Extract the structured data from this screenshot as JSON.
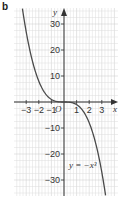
{
  "panel_label": "b",
  "chart_data": {
    "type": "line",
    "title": "",
    "xlabel": "x",
    "ylabel": "y",
    "origin_label": "O",
    "equation_label": "y = −x³",
    "xlim": [
      -4,
      4
    ],
    "ylim": [
      -36,
      36
    ],
    "grid": true,
    "x_ticks": [
      -3,
      -2,
      -1,
      1,
      2,
      3
    ],
    "x_tick_labels": [
      "−3",
      "−2",
      "−1",
      "1",
      "2",
      "3"
    ],
    "y_ticks": [
      30,
      20,
      10,
      -10,
      -20,
      -30
    ],
    "y_tick_labels": [
      "30",
      "20",
      "10",
      "−10",
      "−20",
      "−30"
    ],
    "series": [
      {
        "name": "y = −x³",
        "function": "-x^3",
        "x": [
          -3.3,
          -3,
          -2.5,
          -2,
          -1.5,
          -1,
          -0.5,
          0,
          0.5,
          1,
          1.5,
          2,
          2.5,
          3,
          3.3
        ],
        "y": [
          35.9,
          27,
          15.6,
          8,
          3.4,
          1,
          0.1,
          0,
          -0.1,
          -1,
          -3.4,
          -8,
          -15.6,
          -27,
          -35.9
        ]
      }
    ],
    "colors": {
      "curve": "#4a4a4a",
      "axes": "#333333",
      "grid": "#dcdcdc",
      "grid_major": "#c8c8c8"
    }
  }
}
